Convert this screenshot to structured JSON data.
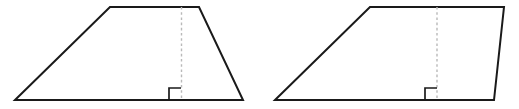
{
  "document": {
    "title": "Two quadrilaterals with height segments",
    "background_color": "#ffffff",
    "width": 519,
    "height": 109
  },
  "style": {
    "outline_color": "#1a1a1a",
    "outline_width": 2,
    "height_line_color": "#b9b9b9",
    "height_line_width": 1.4,
    "height_line_dash": "2.6 2.6",
    "right_angle_color": "#1a1a1a",
    "right_angle_width": 1.7,
    "fill_color": "#ffffff"
  },
  "figures": [
    {
      "name": "trapezoid",
      "shape_type": "trapezoid",
      "description": "Trapezoid with both legs slanting inward toward a shorter top base",
      "vertices": [
        {
          "label": "bottom-left",
          "x": 15,
          "y": 100
        },
        {
          "label": "top-left",
          "x": 110,
          "y": 7
        },
        {
          "label": "top-right",
          "x": 199,
          "y": 7
        },
        {
          "label": "bottom-right",
          "x": 243,
          "y": 100
        }
      ],
      "points_attr": "15,100 110,7 199,7 243,100",
      "height_segment": {
        "name": "height",
        "x": 181.5,
        "y_top": 7,
        "y_bottom": 100
      },
      "right_angle": {
        "name": "right-angle-marker",
        "size": 12,
        "path": "M 169,100 L 169,88 L 181,88"
      }
    },
    {
      "name": "oblique-trapezoid",
      "shape_type": "trapezoid",
      "description": "Trapezoid with a steeply slanted left leg and a nearly vertical right leg",
      "vertices": [
        {
          "label": "bottom-left",
          "x": 275,
          "y": 100
        },
        {
          "label": "top-left",
          "x": 370,
          "y": 7
        },
        {
          "label": "top-right",
          "x": 504,
          "y": 7
        },
        {
          "label": "bottom-right",
          "x": 494,
          "y": 100
        }
      ],
      "points_attr": "275,100 370,7 504,7 494,100",
      "height_segment": {
        "name": "height",
        "x": 437,
        "y_top": 7,
        "y_bottom": 100
      },
      "right_angle": {
        "name": "right-angle-marker",
        "size": 12,
        "path": "M 425,100 L 425,88 L 437,88"
      }
    }
  ]
}
